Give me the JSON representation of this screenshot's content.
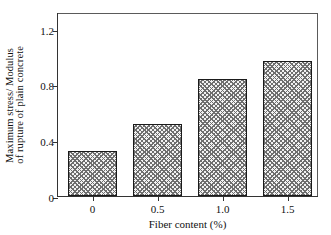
{
  "chart_data": {
    "type": "bar",
    "title": "",
    "xlabel": "Fiber content (%)",
    "ylabel_line1": "Maximum stress/ Modulus",
    "ylabel_line2": "of rupture of plain concrete",
    "categories": [
      "0",
      "0.5",
      "1.0",
      "1.5"
    ],
    "values": [
      0.32,
      0.52,
      0.84,
      0.97
    ],
    "xtick_labels": [
      "0",
      "0.5",
      "1.0",
      "1.5"
    ],
    "ytick_labels": [
      "0",
      "0.4",
      "0.8",
      "1.2"
    ],
    "ytick_values": [
      0,
      0.4,
      0.8,
      1.2
    ],
    "ylim": [
      0,
      1.32
    ],
    "grid": false,
    "legend": "none",
    "bar_fill": "#f2f2f2",
    "bar_hatch": "crosshatch",
    "bar_edge_color": "#1b1b1b",
    "axis_color": "#333333",
    "background": "#ffffff"
  }
}
